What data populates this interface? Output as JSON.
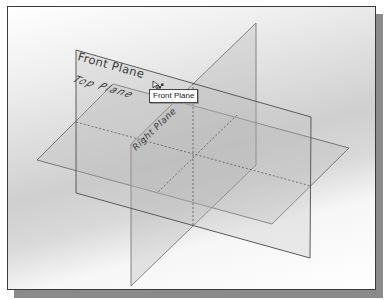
{
  "viewport": {
    "title": "3D sketch viewport with default datum planes"
  },
  "planes": [
    {
      "id": "front",
      "label": "Front Plane"
    },
    {
      "id": "top",
      "label": "Top Plane"
    },
    {
      "id": "right",
      "label": "Right Plane"
    }
  ],
  "tooltip": {
    "text": "Front Plane"
  },
  "cursor": {
    "icon": "select-plane-cursor-icon"
  },
  "colors": {
    "edge": "#6a6a6a",
    "plane_fill": "#bdbdbd",
    "frame": "#3a3a3a",
    "shadow": "#8a8a8a"
  }
}
